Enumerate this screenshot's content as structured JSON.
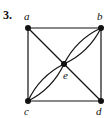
{
  "problem_number": "3.",
  "graph": {
    "vertices": [
      {
        "id": "a",
        "label": "a"
      },
      {
        "id": "b",
        "label": "b"
      },
      {
        "id": "c",
        "label": "c"
      },
      {
        "id": "d",
        "label": "d"
      },
      {
        "id": "e",
        "label": "e"
      }
    ],
    "edges": [
      {
        "from": "a",
        "to": "b",
        "type": "straight"
      },
      {
        "from": "a",
        "to": "c",
        "type": "straight"
      },
      {
        "from": "b",
        "to": "d",
        "type": "straight"
      },
      {
        "from": "c",
        "to": "d",
        "type": "straight"
      },
      {
        "from": "a",
        "to": "e",
        "type": "straight"
      },
      {
        "from": "e",
        "to": "d",
        "type": "straight"
      },
      {
        "from": "b",
        "to": "e",
        "type": "curve-1"
      },
      {
        "from": "b",
        "to": "e",
        "type": "curve-2"
      },
      {
        "from": "c",
        "to": "e",
        "type": "curve-1"
      },
      {
        "from": "c",
        "to": "e",
        "type": "curve-2"
      }
    ]
  }
}
